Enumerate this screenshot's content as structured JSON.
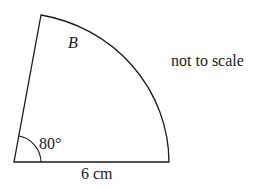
{
  "diagram": {
    "shape": "sector",
    "sector_label": "B",
    "angle_label": "80°",
    "radius_label": "6 cm",
    "note": "not to scale",
    "line_color": "#1a1a1a"
  }
}
